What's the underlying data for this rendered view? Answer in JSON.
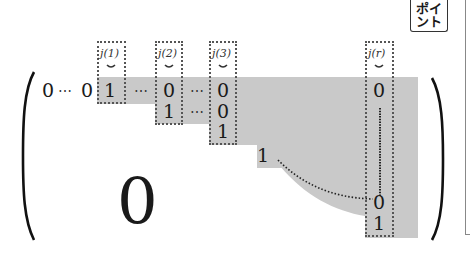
{
  "badge": {
    "line1": "ポイ",
    "line2": "ント"
  },
  "pivot_labels": [
    "j(1)",
    "j(2)",
    "j(3)",
    "j(r)"
  ],
  "pivot_marker": "⌄",
  "matrix": {
    "row1": {
      "lead_zero_a": "0",
      "lead_dots": "⋯",
      "lead_zero_b": "0",
      "pivot1": "1",
      "dots1": "⋯",
      "c2": "0",
      "dots2": "⋯",
      "c3": "0",
      "cr": "0"
    },
    "row2": {
      "pivot2": "1",
      "dots": "⋯",
      "c3": "0"
    },
    "row3": {
      "pivot3": "1"
    },
    "row4": {
      "pivot": "1"
    },
    "col_r": {
      "penultimate": "0",
      "last": "1"
    },
    "zero_block": "0"
  },
  "colors": {
    "shade": "#c9c9c9",
    "ink": "#1a1a1a",
    "dashed_border": "#555555"
  }
}
